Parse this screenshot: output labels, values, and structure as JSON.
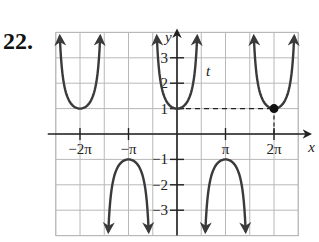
{
  "problem": {
    "number": "22."
  },
  "chart_data": {
    "type": "line",
    "title": "",
    "function": "y = sec(x)",
    "xlabel": "x",
    "ylabel": "y",
    "curve_label": "t",
    "xlim": [
      -2.5,
      2.5
    ],
    "xlim_units": "pi",
    "ylim": [
      -4,
      4
    ],
    "grid": true,
    "grid_x_step": "pi/2",
    "grid_y_step": 1,
    "x_ticks": [
      {
        "value": -2,
        "label": "−2π"
      },
      {
        "value": -1,
        "label": "−π"
      },
      {
        "value": 1,
        "label": "π"
      },
      {
        "value": 2,
        "label": "2π"
      }
    ],
    "y_ticks": [
      {
        "value": 3,
        "label": "3"
      },
      {
        "value": 2,
        "label": "2"
      },
      {
        "value": 1,
        "label": "1"
      },
      {
        "value": -1,
        "label": "−1"
      },
      {
        "value": -2,
        "label": "−2"
      },
      {
        "value": -3,
        "label": "−3"
      }
    ],
    "branches": [
      {
        "center_pi": -2,
        "vertex": 1,
        "direction": "up"
      },
      {
        "center_pi": -1,
        "vertex": -1,
        "direction": "down"
      },
      {
        "center_pi": 0,
        "vertex": 1,
        "direction": "up"
      },
      {
        "center_pi": 1,
        "vertex": -1,
        "direction": "down"
      },
      {
        "center_pi": 2,
        "vertex": 1,
        "direction": "up"
      }
    ],
    "highlighted_point": {
      "x_pi": 2,
      "y": 1,
      "label": "(2π, 1)"
    },
    "annotations": [
      "dashed horizontal line at y=1 from x=0 to x=2π",
      "dashed vertical line at x=2π from y=0 to y=1"
    ],
    "colors": {
      "curve": "#3a3a3a",
      "grid": "#b8b8b8",
      "axis": "#222222"
    }
  }
}
